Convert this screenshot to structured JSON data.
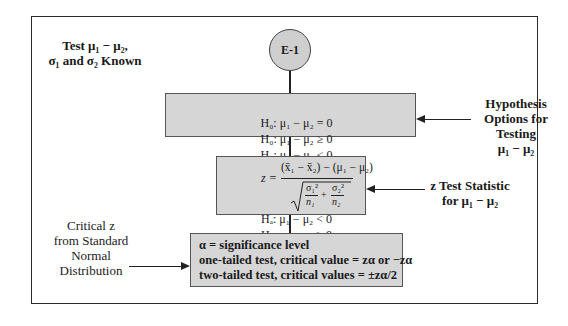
{
  "diagram": {
    "title_label": {
      "line1": "Test μ₁ − μ₂,",
      "line2": "σ₁ and σ₂ Known"
    },
    "start_node": {
      "label": "E-1"
    },
    "hypothesis_box": {
      "rows": [
        [
          "H₀: μ₁ − μ₂ = 0",
          "H₀: μ₁ − μ₂ ≥ 0",
          "H₀: μ₁ − μ₂ ≤ 0"
        ],
        [
          "Hₐ: μ₁ − μ₂ ≠ 0",
          "Hₐ: μ₁ − μ₂ < 0",
          "Hₐ: μ₁ − μ₂ > 0"
        ]
      ]
    },
    "hypothesis_annotation": {
      "line1": "Hypothesis",
      "line2": "Options for",
      "line3": "Testing",
      "line4": "μ₁ − μ₂"
    },
    "statistic_box": {
      "lhs": "z =",
      "numerator": "(x̄₁ − x̄₂) − (μ₁ − μ₂)",
      "denominator_term1_num": "σ₁²",
      "denominator_term1_den": "n₁",
      "plus": "+",
      "denominator_term2_num": "σ₂²",
      "denominator_term2_den": "n₂"
    },
    "statistic_annotation": {
      "line1": "z Test Statistic",
      "line2": "for μ₁ − μ₂"
    },
    "critical_box": {
      "line1": "α = significance level",
      "line2": "one-tailed test, critical value = zα or −zα",
      "line3": "two-tailed test, critical values = ±zα/2"
    },
    "critical_annotation": {
      "line1": "Critical z",
      "line2": "from Standard",
      "line3": "Normal",
      "line4": "Distribution"
    }
  }
}
